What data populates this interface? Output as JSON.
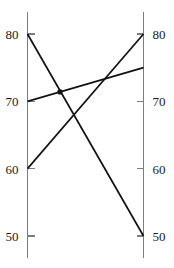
{
  "chart_data": {
    "type": "line",
    "title": "",
    "subtitle": "",
    "xlabel": "",
    "ylabel": "",
    "categories": [
      "Left",
      "Right"
    ],
    "x": [
      0,
      1
    ],
    "ylim": [
      45,
      83
    ],
    "grid": false,
    "legend": "none",
    "axes": [
      {
        "name": "left-axis",
        "position": "left",
        "tick_labels": [
          "80",
          "70",
          "60",
          "50"
        ],
        "tick_values": [
          80,
          70,
          60,
          50
        ]
      },
      {
        "name": "right-axis",
        "position": "right",
        "tick_labels": [
          "80",
          "70",
          "60",
          "50"
        ],
        "tick_values": [
          80,
          70,
          60,
          50
        ]
      }
    ],
    "series": [
      {
        "name": "series-1",
        "values": [
          80,
          50
        ],
        "color": "#121212"
      },
      {
        "name": "series-2",
        "values": [
          60,
          80
        ],
        "color": "#121212"
      },
      {
        "name": "series-3",
        "values": [
          70,
          75
        ],
        "color": "#121212"
      }
    ],
    "markers": [
      {
        "name": "crossing-node",
        "series": "series-3",
        "value": 71.3,
        "position": 0.28
      }
    ]
  },
  "geometry": {
    "left_axis_x": 27.5,
    "right_axis_x": 143.5,
    "axis_top_y": 12,
    "axis_bottom_y": 258,
    "tick_len": 7,
    "value_top": 80,
    "value_top_y": 34,
    "value_bottom": 50,
    "value_bottom_y": 236
  },
  "colors": {
    "background": "#ffffff",
    "axis": "#7d7d7d",
    "line": "#121212",
    "label": "#1a1a1a"
  }
}
